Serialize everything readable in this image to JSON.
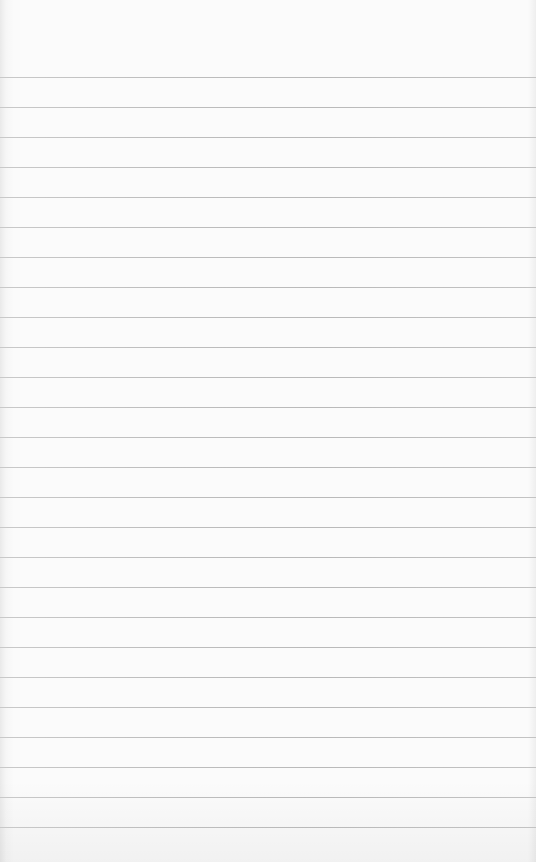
{
  "paper": {
    "background_color": "#fbfbfb",
    "rule_color": "#bdbdbd",
    "first_rule_y": 77,
    "rule_spacing": 30,
    "rule_count": 26
  }
}
